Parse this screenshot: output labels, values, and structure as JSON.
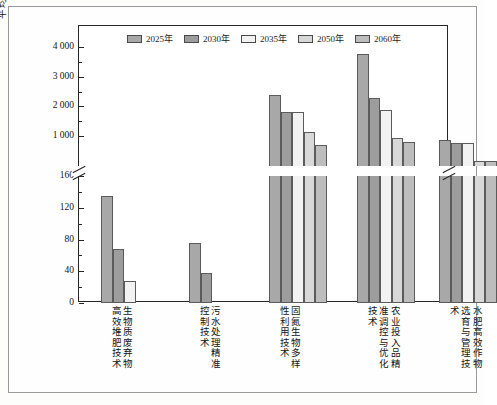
{
  "chart_data": {
    "type": "bar",
    "title": "",
    "xlabel": "",
    "ylabel": "平均减排成本（元/减排tCO₂-eq）",
    "grid": false,
    "legend_position": "top-center",
    "broken_axis": true,
    "axis_lower": {
      "min": 0,
      "max": 160,
      "ticks": [
        0,
        40,
        80,
        120,
        160
      ]
    },
    "axis_upper": {
      "min": 700,
      "max": 4300,
      "ticks": [
        1000,
        2000,
        3000,
        4000
      ]
    },
    "tick_labels_lower": [
      "0",
      "40",
      "80",
      "120",
      "160"
    ],
    "tick_labels_upper": [
      "1 000",
      "2 000",
      "3 000",
      "4 000"
    ],
    "categories": [
      "生物质废弃物高效堆肥技术",
      "污水处理精准控制技术",
      "固氮生物多样性利用技术",
      "农业投入品精准调控与优化技术",
      "水肥高效作物选育与管理技术"
    ],
    "category_columns": [
      [
        "生物质废弃物",
        "高效堆肥技术"
      ],
      [
        "污水处理精准",
        "控制技术"
      ],
      [
        "固氮生物多样",
        "性利用技术"
      ],
      [
        "农业投入品精",
        "准调控与优化",
        "技术"
      ],
      [
        "水肥高效作物",
        "选育与管理技",
        "术"
      ]
    ],
    "series": [
      {
        "name": "2025年",
        "color": "#a8a8a8",
        "values": [
          135,
          75,
          2380,
          3760,
          860
        ]
      },
      {
        "name": "2030年",
        "color": "#9d9d9d",
        "values": [
          68,
          38,
          1800,
          2270,
          780
        ]
      },
      {
        "name": "2035年",
        "color": "#f2f2f2",
        "values": [
          28,
          0,
          1800,
          1880,
          770
        ]
      },
      {
        "name": "2050年",
        "color": "#d8d8d8",
        "values": [
          0,
          0,
          1150,
          940,
          170
        ]
      },
      {
        "name": "2060年",
        "color": "#bdbdbd",
        "values": [
          0,
          0,
          680,
          790,
          170
        ]
      }
    ]
  },
  "legend": {
    "items": [
      {
        "label": "2025年"
      },
      {
        "label": "2030年"
      },
      {
        "label": "2035年"
      },
      {
        "label": "2050年"
      },
      {
        "label": "2060年"
      }
    ]
  }
}
